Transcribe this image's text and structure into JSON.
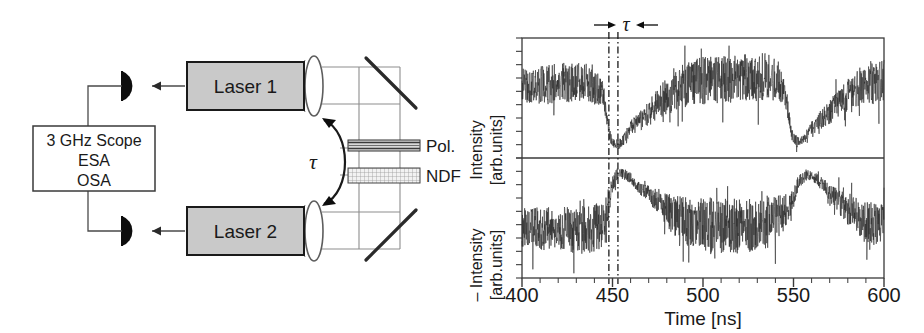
{
  "figure": {
    "kind": "two-panel-figure",
    "left_panel": {
      "name": "experimental-setup-schematic",
      "boxes": [
        {
          "id": "scope",
          "lines": [
            "3 GHz Scope",
            "ESA",
            "OSA"
          ],
          "fill": "#ffffff"
        },
        {
          "id": "laser1",
          "label": "Laser 1",
          "fill": "#c9c9c9"
        },
        {
          "id": "laser2",
          "label": "Laser 2",
          "fill": "#c9c9c9"
        }
      ],
      "optics": [
        {
          "id": "polarizer",
          "label": "Pol."
        },
        {
          "id": "neutral-density-filter",
          "label": "NDF"
        }
      ],
      "coupling_symbol": "τ",
      "components": [
        "photodetector-top",
        "photodetector-bottom",
        "lens-top",
        "lens-bottom",
        "mirror-top",
        "mirror-bottom",
        "beam-path"
      ]
    },
    "right_panel": {
      "name": "time-series-plot",
      "tau_marker": {
        "label": "τ",
        "left_ns": 448,
        "right_ns": 453
      }
    }
  },
  "chart_data": {
    "type": "line",
    "title": "",
    "subtitle": "",
    "xlabel": "Time [ns]",
    "xlim": [
      400,
      600
    ],
    "xticks": [
      400,
      450,
      500,
      550,
      600
    ],
    "xticklabels": [
      "400",
      "450",
      "500",
      "550",
      "600"
    ],
    "minor_tick_step": 10,
    "grid": false,
    "legend": "none",
    "annotations": [
      {
        "text": "τ",
        "type": "interval-marker",
        "from_ns": 448,
        "to_ns": 453,
        "position": "above-axes"
      },
      {
        "text": "dash-dot vertical line",
        "x_ns": 448
      },
      {
        "text": "dash-dot vertical line",
        "x_ns": 453
      }
    ],
    "panels": [
      {
        "id": "upper-trace",
        "ylabel": "Intensity [arb.units]",
        "ylim": [
          0,
          1
        ],
        "yticks_count": 9,
        "yticklabels": [],
        "series": [
          {
            "name": "Laser 1 intensity",
            "color": "#2b2b2b",
            "description": "Chaotic high-frequency intensity fluctuations with two sharp dropout events",
            "envelope_nodes": [
              {
                "t": 400,
                "mean": 0.62,
                "amp": 0.16
              },
              {
                "t": 410,
                "mean": 0.63,
                "amp": 0.17
              },
              {
                "t": 420,
                "mean": 0.65,
                "amp": 0.18
              },
              {
                "t": 430,
                "mean": 0.66,
                "amp": 0.18
              },
              {
                "t": 440,
                "mean": 0.64,
                "amp": 0.17
              },
              {
                "t": 445,
                "mean": 0.55,
                "amp": 0.12
              },
              {
                "t": 448,
                "mean": 0.22,
                "amp": 0.05
              },
              {
                "t": 450,
                "mean": 0.1,
                "amp": 0.04
              },
              {
                "t": 453,
                "mean": 0.1,
                "amp": 0.05
              },
              {
                "t": 456,
                "mean": 0.13,
                "amp": 0.05
              },
              {
                "t": 460,
                "mean": 0.25,
                "amp": 0.07
              },
              {
                "t": 465,
                "mean": 0.3,
                "amp": 0.09
              },
              {
                "t": 470,
                "mean": 0.38,
                "amp": 0.12
              },
              {
                "t": 478,
                "mean": 0.5,
                "amp": 0.16
              },
              {
                "t": 486,
                "mean": 0.6,
                "amp": 0.19
              },
              {
                "t": 495,
                "mean": 0.66,
                "amp": 0.21
              },
              {
                "t": 505,
                "mean": 0.68,
                "amp": 0.22
              },
              {
                "t": 515,
                "mean": 0.69,
                "amp": 0.22
              },
              {
                "t": 525,
                "mean": 0.7,
                "amp": 0.22
              },
              {
                "t": 535,
                "mean": 0.7,
                "amp": 0.22
              },
              {
                "t": 542,
                "mean": 0.66,
                "amp": 0.18
              },
              {
                "t": 546,
                "mean": 0.5,
                "amp": 0.1
              },
              {
                "t": 549,
                "mean": 0.18,
                "amp": 0.05
              },
              {
                "t": 552,
                "mean": 0.12,
                "amp": 0.05
              },
              {
                "t": 556,
                "mean": 0.14,
                "amp": 0.05
              },
              {
                "t": 560,
                "mean": 0.24,
                "amp": 0.07
              },
              {
                "t": 566,
                "mean": 0.33,
                "amp": 0.09
              },
              {
                "t": 572,
                "mean": 0.42,
                "amp": 0.12
              },
              {
                "t": 580,
                "mean": 0.53,
                "amp": 0.16
              },
              {
                "t": 588,
                "mean": 0.62,
                "amp": 0.19
              },
              {
                "t": 595,
                "mean": 0.66,
                "amp": 0.2
              },
              {
                "t": 600,
                "mean": 0.66,
                "amp": 0.2
              }
            ]
          }
        ]
      },
      {
        "id": "lower-trace",
        "ylabel": "– Intensity [arb.units]",
        "ylim": [
          0,
          1
        ],
        "yticks_count": 9,
        "yticklabels": [],
        "series": [
          {
            "name": "Laser 2 negative intensity",
            "color": "#2b2b2b",
            "description": "Inverted chaotic intensity; dropouts appear as upward spikes, delayed by tau",
            "envelope_nodes": [
              {
                "t": 400,
                "mean": 0.42,
                "amp": 0.18
              },
              {
                "t": 410,
                "mean": 0.41,
                "amp": 0.19
              },
              {
                "t": 420,
                "mean": 0.4,
                "amp": 0.2
              },
              {
                "t": 430,
                "mean": 0.39,
                "amp": 0.21
              },
              {
                "t": 440,
                "mean": 0.4,
                "amp": 0.22
              },
              {
                "t": 446,
                "mean": 0.48,
                "amp": 0.2
              },
              {
                "t": 450,
                "mean": 0.78,
                "amp": 0.08
              },
              {
                "t": 453,
                "mean": 0.9,
                "amp": 0.05
              },
              {
                "t": 457,
                "mean": 0.88,
                "amp": 0.05
              },
              {
                "t": 461,
                "mean": 0.84,
                "amp": 0.05
              },
              {
                "t": 465,
                "mean": 0.76,
                "amp": 0.06
              },
              {
                "t": 470,
                "mean": 0.72,
                "amp": 0.07
              },
              {
                "t": 476,
                "mean": 0.62,
                "amp": 0.12
              },
              {
                "t": 484,
                "mean": 0.52,
                "amp": 0.18
              },
              {
                "t": 493,
                "mean": 0.46,
                "amp": 0.22
              },
              {
                "t": 503,
                "mean": 0.44,
                "amp": 0.24
              },
              {
                "t": 513,
                "mean": 0.43,
                "amp": 0.25
              },
              {
                "t": 523,
                "mean": 0.43,
                "amp": 0.25
              },
              {
                "t": 533,
                "mean": 0.44,
                "amp": 0.24
              },
              {
                "t": 542,
                "mean": 0.5,
                "amp": 0.2
              },
              {
                "t": 548,
                "mean": 0.62,
                "amp": 0.12
              },
              {
                "t": 553,
                "mean": 0.82,
                "amp": 0.06
              },
              {
                "t": 558,
                "mean": 0.88,
                "amp": 0.04
              },
              {
                "t": 563,
                "mean": 0.84,
                "amp": 0.05
              },
              {
                "t": 568,
                "mean": 0.76,
                "amp": 0.07
              },
              {
                "t": 574,
                "mean": 0.66,
                "amp": 0.1
              },
              {
                "t": 581,
                "mean": 0.56,
                "amp": 0.14
              },
              {
                "t": 589,
                "mean": 0.47,
                "amp": 0.18
              },
              {
                "t": 596,
                "mean": 0.44,
                "amp": 0.19
              },
              {
                "t": 600,
                "mean": 0.44,
                "amp": 0.19
              }
            ]
          }
        ]
      }
    ]
  }
}
